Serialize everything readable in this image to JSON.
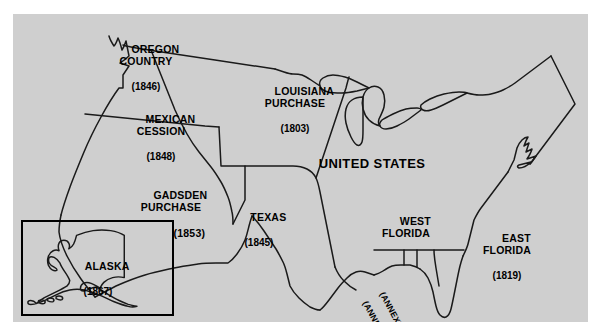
{
  "figure": {
    "kind": "historical-map",
    "region": "United States territorial acquisitions",
    "panel_background": "#cfcfcf",
    "page_background": "#ffffff",
    "outline_color": "#000000"
  },
  "map": {
    "main_label": "UNITED STATES",
    "territories": [
      {
        "id": "oregon-country",
        "name": "OREGON\nCOUNTRY",
        "year": "(1846)"
      },
      {
        "id": "mexican-cession",
        "name": "MEXICAN\nCESSION",
        "year": "(1848)"
      },
      {
        "id": "gadsden-purchase",
        "name": "GADSDEN\nPURCHASE",
        "year": "(1853)"
      },
      {
        "id": "louisiana-purchase",
        "name": "LOUISIANA\nPURCHASE",
        "year": "(1803)"
      },
      {
        "id": "texas",
        "name": "TEXAS",
        "year": "(1845)"
      },
      {
        "id": "west-florida",
        "name": "WEST\nFLORIDA",
        "year": ""
      },
      {
        "id": "east-florida",
        "name": "EAST\nFLORIDA",
        "year": "(1819)"
      },
      {
        "id": "alaska",
        "name": "ALASKA",
        "year": "(1867)"
      }
    ],
    "annotations": [
      {
        "id": "west-florida-annexed-1813",
        "text": "(ANNEXED 1813)"
      },
      {
        "id": "west-florida-annexed-1810",
        "text": "(ANNEXED 1810)"
      }
    ]
  }
}
